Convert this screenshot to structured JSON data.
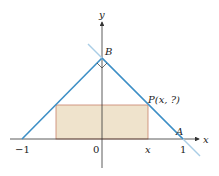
{
  "diagram": {
    "axes": {
      "x_label": "x",
      "y_label": "y"
    },
    "ticks": {
      "neg_one": "−1",
      "zero": "0",
      "x": "x",
      "one": "1"
    },
    "points": {
      "A": "A",
      "B": "B",
      "P": "P(x, ?)"
    },
    "colors": {
      "line": "#3d8fc6",
      "rect_fill": "#efe3cc",
      "rect_stroke": "#c8826a",
      "axis": "#333333"
    }
  }
}
